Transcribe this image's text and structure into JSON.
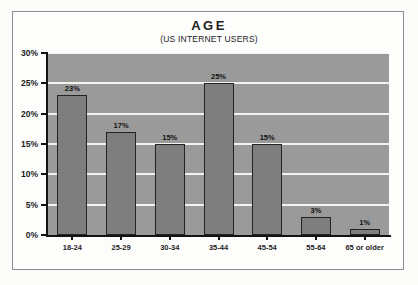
{
  "chart_data": {
    "type": "bar",
    "title": "AGE",
    "subtitle": "(US INTERNET USERS)",
    "xlabel": "",
    "ylabel": "",
    "categories": [
      "18-24",
      "25-29",
      "30-34",
      "35-44",
      "45-54",
      "55-64",
      "65 or older"
    ],
    "values": [
      23,
      17,
      15,
      25,
      15,
      3,
      1
    ],
    "value_labels": [
      "23%",
      "17%",
      "15%",
      "25%",
      "15%",
      "3%",
      "1%"
    ],
    "ylim": [
      0,
      30
    ],
    "y_ticks": [
      0,
      5,
      10,
      15,
      20,
      25,
      30
    ],
    "y_tick_labels": [
      "0%",
      "5%",
      "10%",
      "15%",
      "20%",
      "25%",
      "30%"
    ],
    "grid": true,
    "legend": false,
    "colors": {
      "bar_fill": "#7e7e7e",
      "bar_edge": "#232323",
      "plot_background": "#9a9a9a",
      "gridline": "#f2f2f0",
      "axis": "#121212",
      "text": "#1c1c1c",
      "page_background": "#fdfdfc",
      "frame_border": "#8d8d8d"
    }
  }
}
